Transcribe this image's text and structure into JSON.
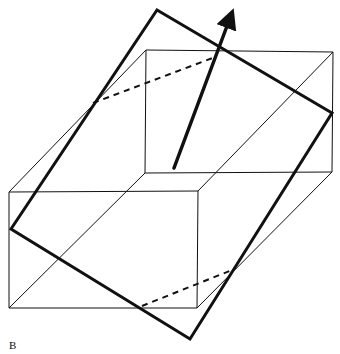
{
  "figure": {
    "label": "B",
    "stroke_color": "#111111",
    "box": {
      "back_face": [
        [
          146,
          50
        ],
        [
          333,
          52
        ],
        [
          332,
          172
        ],
        [
          145,
          173
        ]
      ],
      "front_face": [
        [
          9,
          192
        ],
        [
          198,
          191
        ],
        [
          197,
          308
        ],
        [
          9,
          308
        ]
      ],
      "connecting_edges": [
        [
          [
            9,
            192
          ],
          [
            146,
            50
          ]
        ],
        [
          [
            198,
            191
          ],
          [
            333,
            52
          ]
        ],
        [
          [
            197,
            308
          ],
          [
            332,
            172
          ]
        ],
        [
          [
            9,
            308
          ],
          [
            145,
            173
          ]
        ]
      ]
    },
    "plane": {
      "vertices": [
        [
          157,
          10
        ],
        [
          332,
          113
        ],
        [
          190,
          339
        ],
        [
          11,
          229
        ]
      ]
    },
    "arrow": {
      "from": [
        174,
        168
      ],
      "to": [
        230,
        18
      ]
    },
    "dashed_lines": [
      [
        [
          93,
          103
        ],
        [
          215,
          57
        ]
      ],
      [
        [
          142,
          306
        ],
        [
          232,
          270
        ]
      ]
    ]
  }
}
